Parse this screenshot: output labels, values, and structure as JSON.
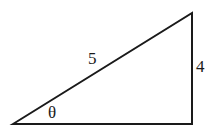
{
  "diagram": {
    "type": "right-triangle",
    "vertices": {
      "bottom_left": [
        13,
        124
      ],
      "top_right": [
        192,
        13
      ],
      "bottom_right": [
        192,
        124
      ]
    },
    "labels": {
      "hypotenuse": "5",
      "opposite": "4",
      "angle": "θ"
    },
    "stroke_color": "#1a1a1a",
    "background": "#ffffff"
  }
}
